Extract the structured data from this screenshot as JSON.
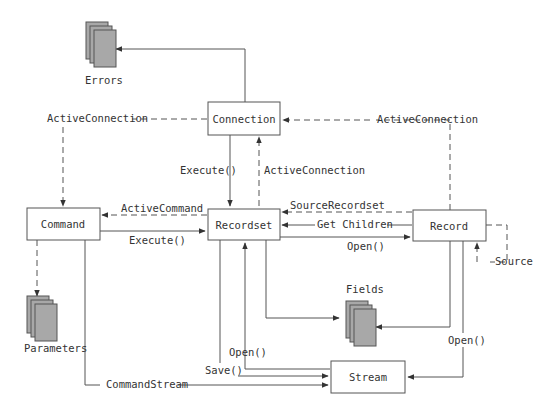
{
  "diagram": {
    "nodes": {
      "connection": "Connection",
      "command": "Command",
      "recordset": "Recordset",
      "record": "Record",
      "stream": "Stream"
    },
    "collections": {
      "errors": "Errors",
      "parameters": "Parameters",
      "fields": "Fields"
    },
    "edges": {
      "cmd_active_connection": "ActiveConnection",
      "rec_active_connection": "ActiveConnection",
      "rs_active_connection": "ActiveConnection",
      "conn_execute": "Execute()",
      "cmd_execute": "Execute()",
      "active_command": "ActiveCommand",
      "source_recordset": "SourceRecordset",
      "get_children": "Get Children",
      "rs_open_record": "Open()",
      "source": "Source",
      "rs_open_stream": "Open()",
      "rs_save": "Save()",
      "command_stream": "CommandStream",
      "rec_open_stream": "Open()"
    }
  }
}
